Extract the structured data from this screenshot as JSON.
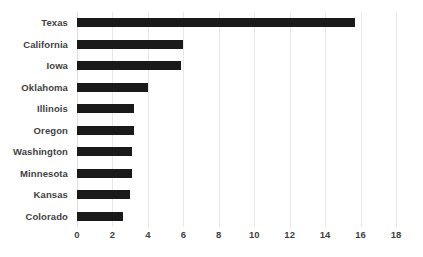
{
  "chart_data": {
    "type": "bar",
    "orientation": "horizontal",
    "title": "",
    "subtitle": "",
    "xlabel": "",
    "ylabel": "",
    "categories": [
      "Texas",
      "California",
      "Iowa",
      "Oklahoma",
      "Illinois",
      "Oregon",
      "Washington",
      "Minnesota",
      "Kansas",
      "Colorado"
    ],
    "values": [
      15.7,
      6.0,
      5.85,
      4.0,
      3.2,
      3.2,
      3.1,
      3.1,
      3.0,
      2.6
    ],
    "series": [
      {
        "name": "",
        "values": [
          15.7,
          6.0,
          5.85,
          4.0,
          3.2,
          3.2,
          3.1,
          3.1,
          3.0,
          2.6
        ]
      }
    ],
    "xlim": [
      0,
      18
    ],
    "ylim": null,
    "xticks": [
      0,
      2,
      4,
      6,
      8,
      10,
      12,
      14,
      16,
      18
    ],
    "xtick_labels": [
      "0",
      "2",
      "4",
      "6",
      "8",
      "10",
      "12",
      "14",
      "16",
      "18"
    ],
    "grid": "vertical",
    "legend": null,
    "legend_position": "none",
    "annotations": [],
    "bar_color": "#1a1a1a",
    "gridline_color": "#e8e8e8",
    "label_color": "#3f3f3f",
    "background_color": "#ffffff"
  }
}
